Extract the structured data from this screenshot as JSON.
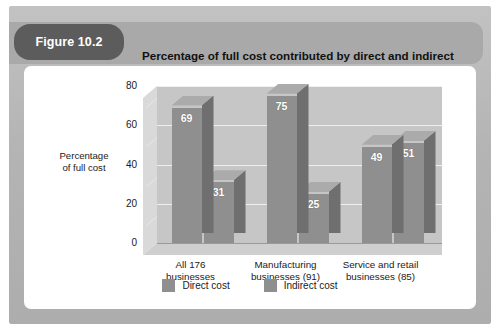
{
  "figure": {
    "badge_label": "Figure 10.2",
    "title": "Percentage of full cost contributed by direct and indirect cost"
  },
  "colors": {
    "page_background": "#ffffff",
    "panel": "#b9b9b9",
    "header_banner": "#a9a9a9",
    "badge": "#5c5c5c",
    "card": "#ffffff",
    "bar_front": "#8f8f8f",
    "bar_side": "#6f6f6f",
    "bar_top": "#ababab",
    "plot_back_wall": "#c6c6c6",
    "plot_side_wall": "#d9d9d9",
    "plot_floor": "#cfcfcf",
    "gridline": "#efefef",
    "label_text": "#1a1a1a",
    "value_text": "#ffffff"
  },
  "chart_data": {
    "type": "bar",
    "title": "Percentage of full cost contributed by direct and indirect cost",
    "xlabel": "",
    "ylabel": "Percentage of full cost",
    "ylabel_lines": [
      "Percentage",
      "of full cost"
    ],
    "ylim": [
      0,
      80
    ],
    "yticks": [
      0,
      20,
      40,
      60,
      80
    ],
    "ytick_labels": [
      "0",
      "20",
      "40",
      "60",
      "80"
    ],
    "grid": true,
    "legend_position": "bottom",
    "categories": [
      "All 176 businesses",
      "Manufacturing businesses (91)",
      "Service and retail businesses (85)"
    ],
    "category_lines": [
      [
        "All 176",
        "businesses"
      ],
      [
        "Manufacturing",
        "businesses (91)"
      ],
      [
        "Service and retail",
        "businesses (85)"
      ]
    ],
    "series": [
      {
        "name": "Direct cost",
        "values": [
          69,
          75,
          49
        ]
      },
      {
        "name": "Indirect cost",
        "values": [
          31,
          25,
          51
        ]
      }
    ]
  }
}
